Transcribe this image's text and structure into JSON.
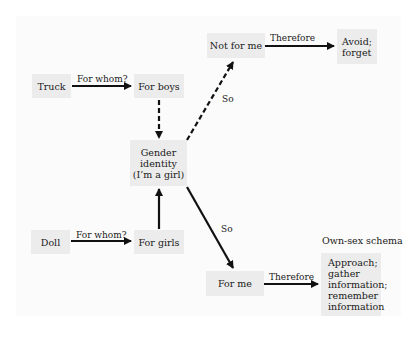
{
  "diagram": {
    "nodes": {
      "truck": "Truck",
      "for_boys": "For boys",
      "not_for_me": "Not for me",
      "avoid_forget": "Avoid;\nforget",
      "gender_identity": "Gender\nidentity\n(I’m a girl)",
      "doll": "Doll",
      "for_girls": "For girls",
      "for_me": "For me",
      "approach": "Approach;\ngather\ninformation;\nremember\ninformation"
    },
    "edge_labels": {
      "truck_to_boys": "For whom?",
      "doll_to_girls": "For whom?",
      "to_not_for_me": "So",
      "to_for_me": "So",
      "not_for_me_to_avoid": "Therefore",
      "for_me_to_approach": "Therefore"
    },
    "schema_label": "Own-sex schema",
    "colors": {
      "box_fill": "#ececec",
      "arrow": "#111111",
      "background": "#fbfbfb"
    }
  }
}
